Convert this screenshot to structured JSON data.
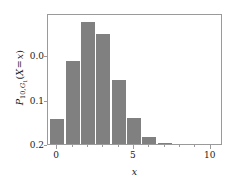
{
  "chart_data": {
    "type": "bar",
    "title": "",
    "subtitle": "",
    "xlabel": "x",
    "ylabel": "P_{10,G1}(X = x)",
    "ylabel_parts": {
      "symbol": "P",
      "subscript": "10, G",
      "subscript_sub": "1",
      "argument": "(X = x)"
    },
    "categories": [
      0,
      1,
      2,
      3,
      4,
      5,
      6,
      7
    ],
    "x": [
      0,
      1,
      2,
      3,
      4,
      5,
      6,
      7
    ],
    "values": [
      0.056,
      0.187,
      0.274,
      0.246,
      0.144,
      0.058,
      0.015,
      0.002
    ],
    "xlim": [
      -0.6,
      10.8
    ],
    "ylim": [
      0.0,
      0.294
    ],
    "xticks": [
      0,
      5,
      10
    ],
    "xticklabels": [
      "0",
      "5",
      "10"
    ],
    "xticks_minor": [
      0,
      1,
      2,
      3,
      4,
      5,
      6,
      7,
      8,
      9,
      10
    ],
    "yticks": [
      0.0,
      0.1,
      0.2
    ],
    "yticklabels": [
      "0.0",
      "0.1",
      "0.2"
    ],
    "grid": false,
    "legend": null,
    "legend_position": "none",
    "bar_width": 0.92,
    "bar_color": "#808080",
    "frame_color": "#9a9a9a",
    "background": "#ffffff"
  }
}
